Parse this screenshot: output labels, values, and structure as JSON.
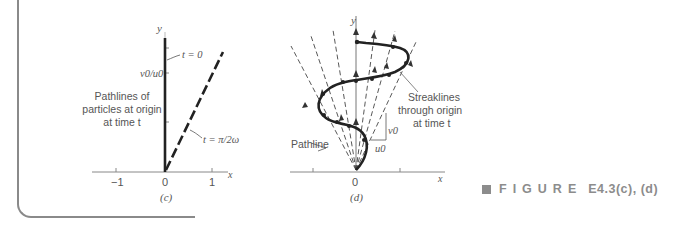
{
  "figure_c": {
    "panel_label": "(c)",
    "axis_x_label": "x",
    "axis_y_label": "y",
    "x_ticks": [
      "−1",
      "0",
      "1"
    ],
    "y_tick_label": "v0/u0",
    "annotation_t0": "t = 0",
    "annotation_t_pi": "t = π/2ω",
    "description_lines": [
      "Pathlines of",
      "particles at origin",
      "at time t"
    ]
  },
  "figure_d": {
    "panel_label": "(d)",
    "axis_x_label": "x",
    "axis_y_label": "y",
    "origin_label": "0",
    "pathline_label": "Pathline",
    "streaklines_lines": [
      "Streaklines",
      "through origin",
      "at time t"
    ],
    "v0_label": "v0",
    "u0_label": "u0"
  },
  "caption": {
    "prefix": "FIGURE",
    "number": "E4.3(c), (d)"
  },
  "colors": {
    "line_dark": "#222222",
    "axis_gray": "#888888",
    "text_gray": "#555555",
    "caption_gray": "#8c8c8c"
  }
}
